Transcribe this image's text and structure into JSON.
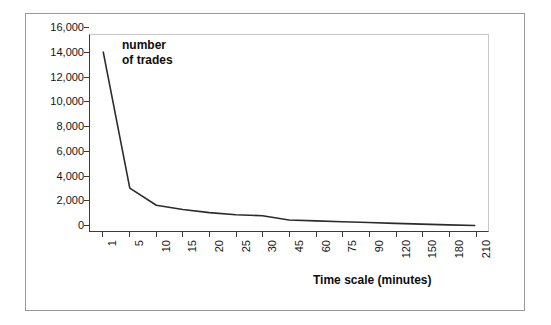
{
  "chart_data": {
    "type": "line",
    "title": "",
    "subtitle": "",
    "xlabel": "Time scale (minutes)",
    "ylabel": "",
    "annotation": "number of trades",
    "annotation_line1": "number",
    "annotation_line2": "of trades",
    "legend": [],
    "legend_position": "none",
    "grid": false,
    "axis_category_spacing": "even",
    "categories": [
      "1",
      "5",
      "10",
      "15",
      "20",
      "25",
      "30",
      "45",
      "60",
      "75",
      "90",
      "120",
      "150",
      "180",
      "210"
    ],
    "series": [
      {
        "name": "number of trades",
        "color": "#2b2b2b",
        "values": [
          14600,
          3500,
          2100,
          1750,
          1500,
          1330,
          1250,
          900,
          830,
          760,
          700,
          620,
          560,
          500,
          450
        ]
      }
    ],
    "x": [
      1,
      5,
      10,
      15,
      20,
      25,
      30,
      45,
      60,
      75,
      90,
      120,
      150,
      180,
      210
    ],
    "xlim": [
      0,
      15
    ],
    "ylim": [
      0,
      16000
    ],
    "yticks": [
      0,
      2000,
      4000,
      6000,
      8000,
      10000,
      12000,
      14000,
      16000
    ],
    "ytick_labels": [
      "0",
      "2,000",
      "4,000",
      "6,000",
      "8,000",
      "10,000",
      "12,000",
      "14,000",
      "16,000"
    ],
    "xtick_labels": [
      "1",
      "5",
      "10",
      "15",
      "20",
      "25",
      "30",
      "45",
      "60",
      "75",
      "90",
      "120",
      "150",
      "180",
      "210"
    ],
    "xtick_label_rotation": -90
  },
  "style": {
    "background": "#ffffff",
    "frame_border": "#9a9a9a",
    "axis_color": "#3a3a3a",
    "plot_border_light": "#c8c8c8",
    "line_color": "#2b2b2b",
    "text_color": "#151515"
  }
}
